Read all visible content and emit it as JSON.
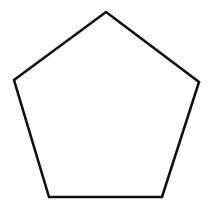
{
  "diagram": {
    "shape": "pentagon",
    "background_color": "#ffffff",
    "stroke_color": "#111111",
    "fill_color": "#ffffff",
    "stroke_width": 2.6,
    "vertices": [
      {
        "name": "top",
        "x": 106,
        "y": 12
      },
      {
        "name": "right",
        "x": 199,
        "y": 82
      },
      {
        "name": "bottom-right",
        "x": 162,
        "y": 197
      },
      {
        "name": "bottom-left",
        "x": 49,
        "y": 197
      },
      {
        "name": "left",
        "x": 14,
        "y": 80
      }
    ]
  }
}
